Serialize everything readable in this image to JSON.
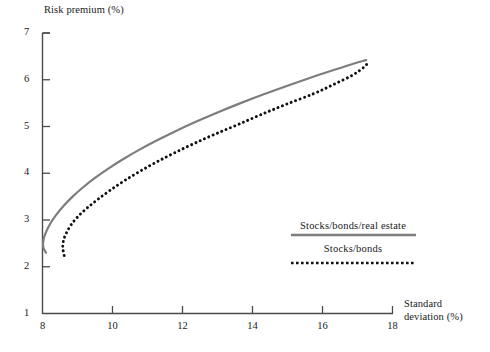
{
  "chart_data": {
    "type": "line",
    "title": "",
    "subtitle": "",
    "xlabel": "Standard deviation (%)",
    "ylabel": "Risk premium (%)",
    "xlim": [
      8,
      18
    ],
    "ylim": [
      1,
      7
    ],
    "xticks": [
      8,
      10,
      12,
      14,
      16,
      18
    ],
    "yticks": [
      1,
      2,
      3,
      4,
      5,
      6,
      7
    ],
    "xtick_labels": [
      "8",
      "10",
      "12",
      "14",
      "16",
      "18"
    ],
    "ytick_labels": [
      "1",
      "2",
      "3",
      "4",
      "5",
      "6",
      "7"
    ],
    "grid": false,
    "legend_position": "inside-lower-right",
    "series": [
      {
        "name": "Stocks/bonds/real estate",
        "style": "solid",
        "color": "#7d7d7d",
        "points": [
          [
            8.1,
            2.3
          ],
          [
            8.02,
            2.42
          ],
          [
            8.03,
            2.58
          ],
          [
            8.1,
            2.74
          ],
          [
            8.22,
            2.92
          ],
          [
            8.38,
            3.1
          ],
          [
            8.6,
            3.3
          ],
          [
            8.86,
            3.5
          ],
          [
            9.16,
            3.7
          ],
          [
            9.5,
            3.9
          ],
          [
            9.88,
            4.1
          ],
          [
            10.3,
            4.3
          ],
          [
            10.76,
            4.5
          ],
          [
            11.26,
            4.7
          ],
          [
            11.8,
            4.9
          ],
          [
            12.38,
            5.1
          ],
          [
            13.0,
            5.3
          ],
          [
            13.66,
            5.5
          ],
          [
            14.36,
            5.7
          ],
          [
            15.1,
            5.9
          ],
          [
            15.88,
            6.1
          ],
          [
            16.7,
            6.3
          ],
          [
            17.25,
            6.42
          ]
        ]
      },
      {
        "name": "Stocks/bonds",
        "style": "dotted",
        "color": "#111111",
        "points": [
          [
            8.62,
            2.24
          ],
          [
            8.58,
            2.4
          ],
          [
            8.6,
            2.56
          ],
          [
            8.68,
            2.72
          ],
          [
            8.82,
            2.9
          ],
          [
            9.02,
            3.08
          ],
          [
            9.28,
            3.26
          ],
          [
            9.58,
            3.44
          ],
          [
            9.94,
            3.64
          ],
          [
            10.34,
            3.84
          ],
          [
            10.78,
            4.04
          ],
          [
            11.26,
            4.24
          ],
          [
            11.78,
            4.44
          ],
          [
            12.34,
            4.64
          ],
          [
            12.94,
            4.84
          ],
          [
            13.58,
            5.04
          ],
          [
            14.26,
            5.26
          ],
          [
            14.98,
            5.48
          ],
          [
            15.74,
            5.7
          ],
          [
            16.32,
            5.9
          ],
          [
            16.86,
            6.1
          ],
          [
            17.2,
            6.28
          ],
          [
            17.32,
            6.4
          ]
        ]
      }
    ],
    "annotations": []
  },
  "legend": {
    "entries": [
      {
        "label": "Stocks/bonds/real estate",
        "style": "solid",
        "color": "#7d7d7d"
      },
      {
        "label": "Stocks/bonds",
        "style": "dotted",
        "color": "#111111"
      }
    ]
  },
  "axes": {
    "y_title": "Risk premium (%)",
    "x_title_line1": "Standard",
    "x_title_line2": "deviation (%)"
  }
}
